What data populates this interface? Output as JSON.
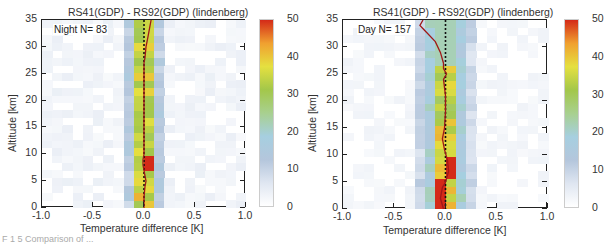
{
  "chart_data": [
    {
      "type": "heatmap",
      "title": "RS41(GDP) - RS92(GDP) (lindenberg)",
      "legend_label": "Night N= 83",
      "xlabel": "Temperature difference [K]",
      "ylabel": "Altitude [km]",
      "xlim": [
        -1.0,
        1.0
      ],
      "ylim": [
        0,
        35
      ],
      "x_ticks": [
        "-1.0",
        "-0.5",
        "0.0",
        "0.5",
        "1.0"
      ],
      "y_ticks": [
        "0",
        "5",
        "10",
        "15",
        "20",
        "25",
        "30",
        "35"
      ],
      "colorbar": {
        "min": 0,
        "max": 50,
        "ticks": [
          "0",
          "10",
          "20",
          "30",
          "40",
          "50"
        ]
      },
      "bin_width_K": 0.1,
      "bin_height_km": 1.4,
      "mean_profile": {
        "altitude_km": [
          0,
          2,
          4,
          5,
          6,
          8,
          9,
          10,
          12,
          15,
          20,
          25,
          27,
          28,
          30,
          32,
          35
        ],
        "diff_K": [
          0.0,
          0.0,
          0.01,
          0.02,
          0.01,
          -0.01,
          -0.01,
          0.0,
          0.0,
          0.0,
          0.0,
          0.0,
          0.0,
          0.01,
          0.02,
          0.04,
          0.07
        ]
      },
      "highlight_cells": [
        {
          "x_bin": [
            0.0,
            0.1
          ],
          "alt_km": [
            7,
            10
          ],
          "value": 50
        },
        {
          "x_bin": [
            -0.1,
            0.0
          ],
          "alt_km": [
            1.5,
            3
          ],
          "value": 42
        }
      ]
    },
    {
      "type": "heatmap",
      "title": "RS41(GDP) - RS92(GDP) (lindenberg)",
      "legend_label": "Day N= 157",
      "xlabel": "Temperature difference [K]",
      "ylabel": "Altitude [km]",
      "xlim": [
        -1.0,
        1.0
      ],
      "ylim": [
        0,
        35
      ],
      "x_ticks": [
        "-1.0",
        "-0.5",
        "0.0",
        "0.5",
        "1.0"
      ],
      "y_ticks": [
        "0",
        "5",
        "10",
        "15",
        "20",
        "25",
        "30",
        "35"
      ],
      "colorbar": {
        "min": 0,
        "max": 50,
        "ticks": [
          "0",
          "10",
          "20",
          "30",
          "40",
          "50"
        ]
      },
      "bin_width_K": 0.1,
      "bin_height_km": 1.4,
      "mean_profile": {
        "altitude_km": [
          0,
          2,
          4,
          5,
          7,
          9,
          11,
          13,
          15,
          18,
          21,
          24,
          25,
          26,
          27,
          29,
          31,
          33,
          34,
          35
        ],
        "diff_K": [
          -0.02,
          -0.05,
          -0.03,
          0.0,
          0.03,
          0.02,
          -0.01,
          -0.03,
          -0.01,
          0.0,
          0.0,
          -0.02,
          0.01,
          -0.02,
          -0.02,
          -0.05,
          -0.1,
          -0.2,
          -0.25,
          -0.22
        ]
      },
      "highlight_cells": [
        {
          "x_bin": [
            -0.1,
            0.0
          ],
          "alt_km": [
            0,
            5
          ],
          "value": 50
        },
        {
          "x_bin": [
            0.0,
            0.1
          ],
          "alt_km": [
            6,
            10
          ],
          "value": 50
        },
        {
          "x_bin": [
            0.0,
            0.1
          ],
          "alt_km": [
            1,
            2
          ],
          "value": 50
        }
      ]
    }
  ],
  "panels": [
    {
      "title": "RS41(GDP) - RS92(GDP) (lindenberg)",
      "legend": "Night N= 83",
      "xlabel": "Temperature difference [K]",
      "ylabel": "Altitude [km]"
    },
    {
      "title": "RS41(GDP) - RS92(GDP) (lindenberg)",
      "legend": "Day N= 157",
      "xlabel": "Temperature difference [K]",
      "ylabel": "Altitude [km]"
    }
  ],
  "x_ticks": [
    "-1.0",
    "-0.5",
    "0.0",
    "0.5",
    "1.0"
  ],
  "y_ticks": [
    "0",
    "5",
    "10",
    "15",
    "20",
    "25",
    "30",
    "35"
  ],
  "colorbar_ticks": [
    "0",
    "10",
    "20",
    "30",
    "40",
    "50"
  ],
  "colors": {
    "profile_line": "#a01818",
    "zero_line": "#111111",
    "colormap": [
      "#ffffff",
      "#dfe6f1",
      "#b4c6dc",
      "#a6cfe0",
      "#a8d08f",
      "#a3c74a",
      "#e5e040",
      "#f0a030",
      "#d42a18"
    ]
  },
  "caption_fragment": "F 1 5  Comparison of ..."
}
